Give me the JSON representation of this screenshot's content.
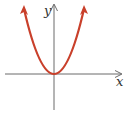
{
  "figure": {
    "function": "y = x^2",
    "x_axis_label": "x",
    "y_axis_label": "y",
    "colors": {
      "curve": "#c9402b",
      "axes": "#6b6b6b",
      "labels": "#333333",
      "background": "#ffffff"
    }
  }
}
